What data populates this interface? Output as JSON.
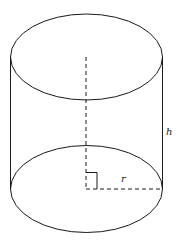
{
  "diagram": {
    "labels": {
      "height": "h",
      "radius": "r"
    },
    "colors": {
      "stroke": "#1a1a1a",
      "background": "#ffffff"
    }
  }
}
